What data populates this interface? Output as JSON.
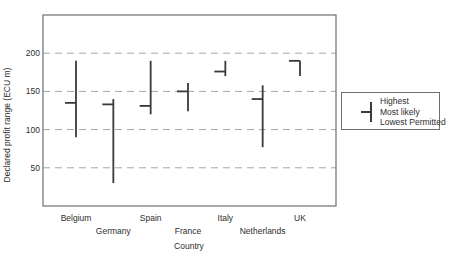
{
  "chart_data": {
    "type": "range-bar",
    "title": "",
    "xlabel": "Country",
    "ylabel": "Declared profit range (ECU m)",
    "categories": [
      "Belgium",
      "Germany",
      "Spain",
      "France",
      "Italy",
      "Netherlands",
      "UK"
    ],
    "series": [
      {
        "name": "Highest",
        "values": [
          190,
          140,
          190,
          161,
          190,
          158,
          190
        ]
      },
      {
        "name": "Most likely",
        "values": [
          135,
          133,
          131,
          150,
          176,
          140,
          190
        ]
      },
      {
        "name": "Lowest Permitted",
        "values": [
          90,
          30,
          120,
          124,
          170,
          77,
          170
        ]
      }
    ],
    "yticks": [
      50,
      100,
      150,
      200
    ],
    "ylim": [
      0,
      250
    ],
    "grid": "dashed-horizontal",
    "legend": {
      "position": "right",
      "entries": [
        "Highest",
        "Most likely",
        "Lowest Permitted"
      ]
    },
    "colors": {
      "marker_line": "#3a3a3a",
      "gridline": "#a6a6a6",
      "plot_border": "#6f6f6f",
      "text": "#2e2e2e"
    }
  }
}
